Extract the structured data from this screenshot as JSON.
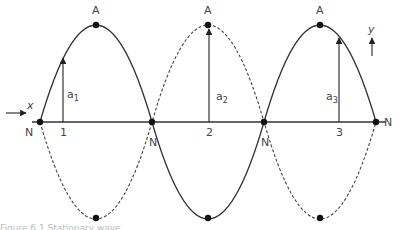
{
  "diagram": {
    "type": "standing-wave",
    "axes": {
      "x_label": "x",
      "y_label": "y"
    },
    "node_label": "N",
    "antinode_label": "A",
    "nodes": [
      {
        "label": "N",
        "x": 40
      },
      {
        "label": "N",
        "x": 152
      },
      {
        "label": "N",
        "x": 264
      },
      {
        "label": "N",
        "x": 376
      }
    ],
    "antinodes": [
      {
        "label": "A",
        "x": 96
      },
      {
        "label": "A",
        "x": 208
      },
      {
        "label": "A",
        "x": 320
      }
    ],
    "points": [
      {
        "label": "1",
        "x": 63
      },
      {
        "label": "2",
        "x": 210
      },
      {
        "label": "3",
        "x": 340
      }
    ],
    "amplitudes": [
      {
        "symbol": "a",
        "sub": "1"
      },
      {
        "symbol": "a",
        "sub": "2"
      },
      {
        "symbol": "a",
        "sub": "3"
      }
    ],
    "curves": [
      {
        "style": "solid",
        "shape": "up-down-up"
      },
      {
        "style": "dashed",
        "shape": "down-up-down"
      }
    ],
    "caption": "Figure 6.1 Stationary wave"
  }
}
